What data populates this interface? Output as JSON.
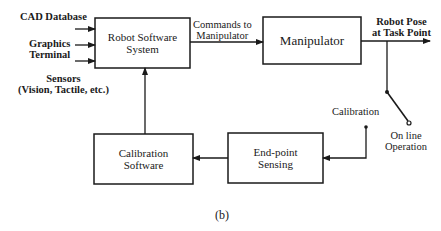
{
  "inputs": {
    "cad": "CAD Database",
    "graphics_line1": "Graphics",
    "graphics_line2": "Terminal",
    "sensors_line1": "Sensors",
    "sensors_line2": "(Vision, Tactile, etc.)"
  },
  "blocks": {
    "robot_software": {
      "line1": "Robot Software",
      "line2": "System"
    },
    "manipulator": {
      "line1": "Manipulator"
    },
    "calibration_software": {
      "line1": "Calibration",
      "line2": "Software"
    },
    "endpoint_sensing": {
      "line1": "End-point",
      "line2": "Sensing"
    }
  },
  "edges": {
    "commands_line1": "Commands to",
    "commands_line2": "Manipulator",
    "pose_line1": "Robot Pose",
    "pose_line2": "at Task Point"
  },
  "switch": {
    "calibration": "Calibration",
    "online_line1": "On line",
    "online_line2": "Operation"
  },
  "caption": "(b)"
}
